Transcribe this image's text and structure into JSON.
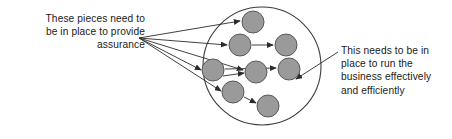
{
  "diagram": {
    "left_annotation": {
      "text": "These pieces need to\nbe in place to provide\nassurance",
      "align": "right"
    },
    "right_annotation": {
      "text": "This needs to be in\nplace to run the\nbusiness effectively\nand efficiently",
      "align": "left"
    },
    "colors": {
      "node_fill": "#9a9a9a",
      "node_stroke": "#595959",
      "line": "#2b2b2b",
      "circle_stroke": "#3d3d3d",
      "text": "#1a1a1a",
      "background": "#ffffff"
    },
    "boundary_circle": {
      "cx": 262,
      "cy": 66,
      "r": 59
    },
    "nodes": [
      {
        "id": "node-1",
        "cx": 253,
        "cy": 22,
        "r": 11
      },
      {
        "id": "node-2",
        "cx": 240,
        "cy": 45,
        "r": 11
      },
      {
        "id": "node-3",
        "cx": 286,
        "cy": 45,
        "r": 11
      },
      {
        "id": "node-4",
        "cx": 213,
        "cy": 70,
        "r": 11
      },
      {
        "id": "node-5",
        "cx": 256,
        "cy": 72,
        "r": 11
      },
      {
        "id": "node-6",
        "cx": 289,
        "cy": 69,
        "r": 11
      },
      {
        "id": "node-7",
        "cx": 233,
        "cy": 92,
        "r": 11
      },
      {
        "id": "node-8",
        "cx": 268,
        "cy": 106,
        "r": 11
      }
    ],
    "convergence_point": {
      "x": 139,
      "y": 38
    },
    "fan_arrows": [
      {
        "id": "fan-arrow-1",
        "to": "node-1",
        "x2": 240,
        "y2": 21
      },
      {
        "id": "fan-arrow-2",
        "to": "node-2",
        "x2": 227,
        "y2": 45
      },
      {
        "id": "fan-arrow-3",
        "to": "node-5",
        "x2": 243,
        "y2": 70
      },
      {
        "id": "fan-arrow-4",
        "to": "node-4",
        "x2": 201,
        "y2": 70
      },
      {
        "id": "fan-arrow-5",
        "to": "node-7",
        "x2": 221,
        "y2": 91
      }
    ],
    "internal_arrows": [
      {
        "id": "internal-arrow-1",
        "from": "node-2",
        "to": "node-3",
        "x1": 252,
        "y1": 45,
        "x2": 273,
        "y2": 45
      },
      {
        "id": "internal-arrow-2",
        "from": "node-4",
        "to": "node-6",
        "x1": 225,
        "y1": 69,
        "x2": 276,
        "y2": 68
      },
      {
        "id": "internal-arrow-3",
        "from": "node-4",
        "to": "node-5",
        "x1": 223,
        "y1": 76,
        "x2": 244,
        "y2": 73
      },
      {
        "id": "internal-arrow-4",
        "from": "node-7",
        "to": "node-8",
        "x1": 244,
        "y1": 97,
        "x2": 256,
        "y2": 103
      }
    ],
    "pointer_arrow": {
      "id": "pointer-arrow",
      "x1": 338,
      "y1": 52,
      "x2": 296,
      "y2": 79
    }
  }
}
